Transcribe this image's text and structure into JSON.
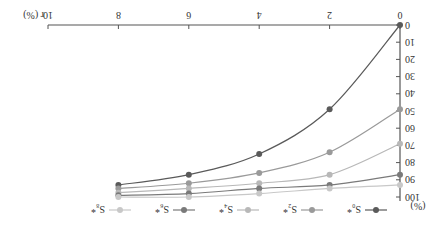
{
  "chart_data": {
    "type": "line",
    "title": "",
    "xlabel": "r (%)",
    "ylabel": "(%)",
    "x": [
      0,
      2,
      4,
      6,
      8
    ],
    "xticks": [
      0,
      2,
      4,
      6,
      8,
      10
    ],
    "yticks": [
      0,
      10,
      20,
      30,
      40,
      50,
      60,
      70,
      80,
      90,
      100
    ],
    "xlim": [
      0,
      10
    ],
    "ylim": [
      0,
      100
    ],
    "grid": false,
    "legend_position": "bottom",
    "orientation_note": "rendered rotated 180 degrees",
    "series": [
      {
        "name": "S₀*",
        "color": "#5a5a5a",
        "values": [
          0,
          49,
          75,
          87,
          93
        ]
      },
      {
        "name": "S₂*",
        "color": "#9a9a9a",
        "values": [
          49,
          74,
          86,
          92,
          95
        ]
      },
      {
        "name": "S₄*",
        "color": "#b8b8b8",
        "values": [
          69,
          87,
          92,
          95,
          97.5
        ]
      },
      {
        "name": "S₆*",
        "color": "#7a7a7a",
        "values": [
          87,
          93,
          95,
          98,
          99
        ]
      },
      {
        "name": "S₈*",
        "color": "#c8c8c8",
        "values": [
          93,
          95,
          98,
          100,
          100
        ]
      }
    ]
  },
  "axis": {
    "x_label": "r (%)",
    "y_label": "(%)"
  },
  "legend": [
    "S₀*",
    "S₂*",
    "S₄*",
    "S₆*",
    "S₈*"
  ]
}
